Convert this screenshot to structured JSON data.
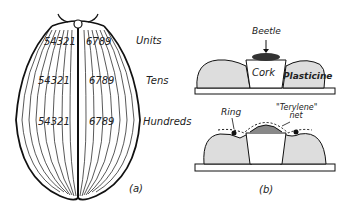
{
  "figure_a": {
    "caption": "(a)",
    "rows": [
      {
        "name": "Units",
        "left_digits": "54321",
        "right_digits": "6789"
      },
      {
        "name": "Tens",
        "left_digits": "54321",
        "right_digits": "6789"
      },
      {
        "name": "Hundreds",
        "left_digits": "54321",
        "right_digits": "6789"
      }
    ]
  },
  "figure_b": {
    "caption": "(b)",
    "top": {
      "beetle": "Beetle",
      "cork": "Cork",
      "plasticine": "Plasticine"
    },
    "bottom": {
      "ring": "Ring",
      "net": "\"Terylene\" net"
    }
  }
}
